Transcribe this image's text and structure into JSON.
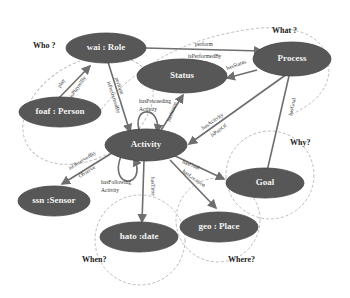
{
  "diagram": {
    "type": "ontology-graph",
    "nodes": {
      "role": "wai : Role",
      "person": "foaf : Person",
      "process": "Process",
      "status": "Status",
      "activity": "Activity",
      "sensor": "ssn :Sensor",
      "goal": "Goal",
      "date": "hato :date",
      "place": "geo : Place"
    },
    "questions": {
      "who": "Who ?",
      "what": "What ?",
      "why": "Why?",
      "when": "When?",
      "where": "Where?"
    },
    "edges": {
      "perform": "perform",
      "isPerformedBy_top": "isPerformedBy",
      "play": "play",
      "isPlayedBy": "isPlayedBy",
      "perform2": "perform",
      "isPerformedBy2": "isPerformedBy",
      "hasStatus": "hasStatus",
      "hasStatus2": "hasStatus",
      "hasActivity": "hasActivity",
      "isPartOf": "isPartOf",
      "hasGoal_process": "hasGoal",
      "hasProceeding1": "hasProceeding",
      "hasProceeding2": "Activity",
      "hasFollowing1": "hasFollowing",
      "hasFollowing2": "Activity",
      "isObservedBy": "isObservedBy",
      "observe": "Observe",
      "hasTime": "hasTime",
      "hasGoal": "hasGoal",
      "hasLocation": "hasLocation"
    }
  }
}
